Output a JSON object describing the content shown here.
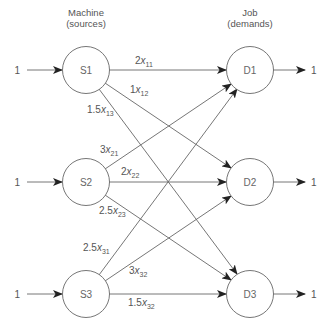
{
  "headers": {
    "sources_line1": "Machine",
    "sources_line2": "(sources)",
    "demands_line1": "Job",
    "demands_line2": "(demands)"
  },
  "sources": [
    {
      "id": "S1",
      "supply": "1"
    },
    {
      "id": "S2",
      "supply": "1"
    },
    {
      "id": "S3",
      "supply": "1"
    }
  ],
  "demands": [
    {
      "id": "D1",
      "demand": "1"
    },
    {
      "id": "D2",
      "demand": "1"
    },
    {
      "id": "D3",
      "demand": "1"
    }
  ],
  "edges": [
    {
      "from": "S1",
      "to": "D1",
      "coef": "2",
      "var": "x",
      "sub": "11"
    },
    {
      "from": "S1",
      "to": "D2",
      "coef": "1",
      "var": "x",
      "sub": "12"
    },
    {
      "from": "S1",
      "to": "D3",
      "coef": "1.5",
      "var": "x",
      "sub": "13"
    },
    {
      "from": "S2",
      "to": "D1",
      "coef": "3",
      "var": "x",
      "sub": "21"
    },
    {
      "from": "S2",
      "to": "D2",
      "coef": "2",
      "var": "x",
      "sub": "22"
    },
    {
      "from": "S2",
      "to": "D3",
      "coef": "2.5",
      "var": "x",
      "sub": "23"
    },
    {
      "from": "S3",
      "to": "D1",
      "coef": "2.5",
      "var": "x",
      "sub": "31"
    },
    {
      "from": "S3",
      "to": "D2",
      "coef": "3",
      "var": "x",
      "sub": "32"
    },
    {
      "from": "S3",
      "to": "D3",
      "coef": "1.5",
      "var": "x",
      "sub": "32"
    }
  ],
  "colors": {
    "line": "#666666",
    "text": "#555555",
    "background": "#ffffff"
  }
}
